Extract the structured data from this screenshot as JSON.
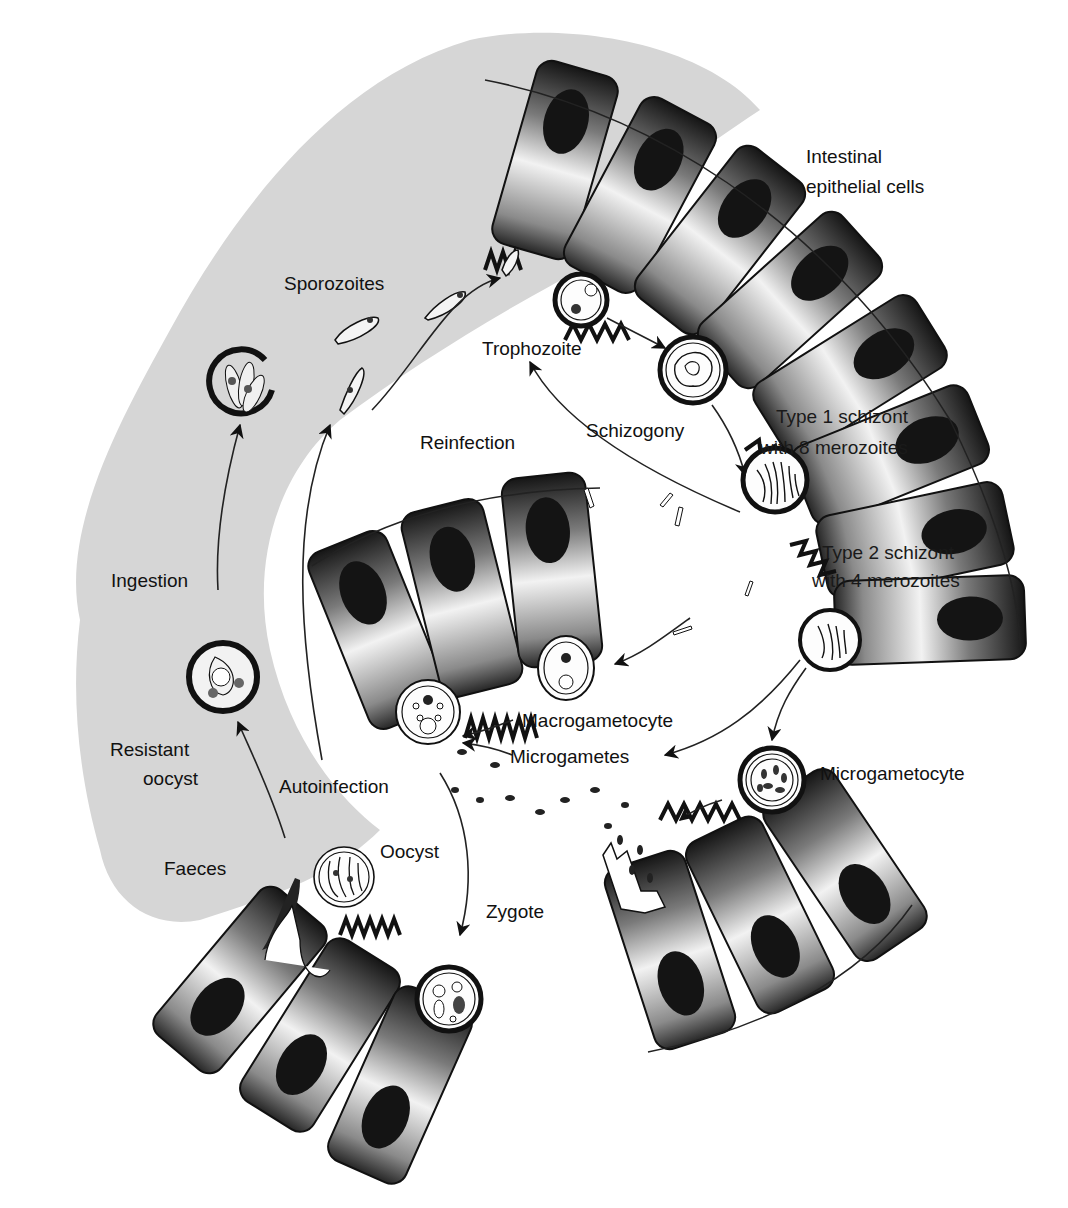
{
  "diagram": {
    "colors": {
      "lumen_background": "#d6d6d6",
      "cell_dark": "#161616",
      "cell_light": "#f4f4f4",
      "nucleus": "#141414",
      "stroke": "#111111"
    },
    "labels": {
      "intestinal_epithelial_cells_line1": "Intestinal",
      "intestinal_epithelial_cells_line2": "epithelial cells",
      "sporozoites": "Sporozoites",
      "trophozoite": "Trophozoite",
      "reinfection": "Reinfection",
      "schizogony": "Schizogony",
      "type1_schizont_line1": "Type 1 schizont",
      "type1_schizont_line2": "with 8 merozoites",
      "type2_schizont_line1": "Type 2 schizont",
      "type2_schizont_line2": "with 4 merozoites",
      "ingestion": "Ingestion",
      "resistant_oocyst_line1": "Resistant",
      "resistant_oocyst_line2": "oocyst",
      "autoinfection": "Autoinfection",
      "macrogametocyte": "Macrogametocyte",
      "microgametes": "Microgametes",
      "microgametocyte": "Microgametocyte",
      "faeces": "Faeces",
      "oocyst": "Oocyst",
      "zygote": "Zygote"
    }
  }
}
